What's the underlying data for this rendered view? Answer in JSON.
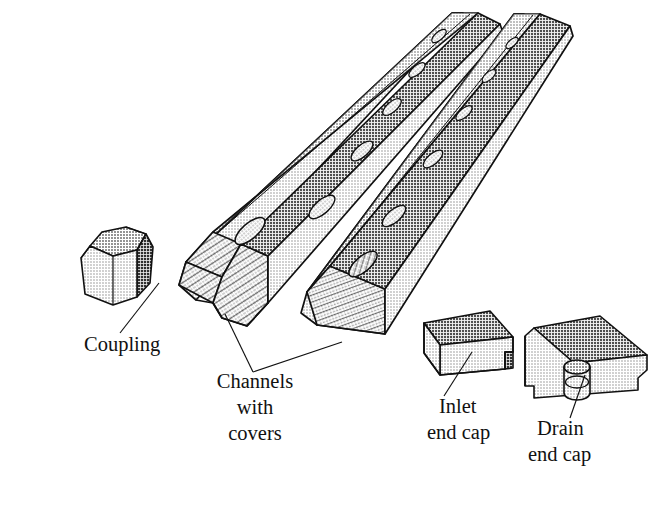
{
  "figure": {
    "kind": "exploded-assembly-line-drawing",
    "background_color": "#ffffff",
    "line_color": "#111111",
    "fill_light": "#dcdcdc",
    "fill_mid": "#c8c8c8",
    "fill_dark": "#a8a8a8",
    "fill_shadow": "#8f8f8f"
  },
  "labels": [
    {
      "id": "coupling",
      "name": "coupling-label",
      "lines": [
        "Coupling"
      ],
      "x": 84,
      "y": 351,
      "align": "start",
      "leader": [
        [
          120,
          333
        ],
        [
          159,
          283
        ]
      ]
    },
    {
      "id": "channels",
      "name": "channels-with-covers-label",
      "lines": [
        "Channels",
        "with",
        "covers"
      ],
      "x": 255,
      "y": 388,
      "align": "middle",
      "leader_join": [
        253,
        372
      ],
      "leader_a": [
        [
          253,
          372
        ],
        [
          225,
          314
        ]
      ],
      "leader_b": [
        [
          253,
          372
        ],
        [
          342,
          342
        ]
      ]
    },
    {
      "id": "inlet",
      "name": "inlet-end-cap-label",
      "lines": [
        "Inlet",
        "end cap"
      ],
      "x": 439,
      "y": 413,
      "align": "start",
      "leader": [
        [
          444,
          396
        ],
        [
          472,
          352
        ]
      ]
    },
    {
      "id": "drain",
      "name": "drain-end-cap-label",
      "lines": [
        "Drain",
        "end cap"
      ],
      "x": 537,
      "y": 435,
      "align": "start",
      "leader": [
        [
          570,
          418
        ],
        [
          585,
          375
        ]
      ]
    }
  ],
  "parts": [
    {
      "id": "coupling",
      "name": "coupling-part",
      "description": "Short chamfered connector block shown separate at left"
    },
    {
      "id": "channel-left",
      "name": "channel-left-part",
      "description": "Deep channel with cover, chamfered end, hatched cut face, row of drain holes"
    },
    {
      "id": "channel-right",
      "name": "channel-right-part",
      "description": "Shallow channel with cover, hatched cut face, row of drain holes"
    },
    {
      "id": "inlet-end-cap",
      "name": "inlet-end-cap-part",
      "description": "Flat end cap with stepped notch at right end"
    },
    {
      "id": "drain-end-cap",
      "name": "drain-end-cap-part",
      "description": "End cap with cylindrical drain spout on front face"
    }
  ],
  "channel_left_holes": [
    {
      "cx": 439,
      "cy": 36,
      "rx": 9,
      "ry": 4.0
    },
    {
      "cx": 417,
      "cy": 70,
      "rx": 10,
      "ry": 4.4
    },
    {
      "cx": 392,
      "cy": 107,
      "rx": 11.5,
      "ry": 5.0
    },
    {
      "cx": 362,
      "cy": 151,
      "rx": 13.5,
      "ry": 5.8
    },
    {
      "cx": 324,
      "cy": 207,
      "rx": 16,
      "ry": 6.8
    },
    {
      "cx": 252,
      "cy": 231,
      "rx": 18.5,
      "ry": 7.8
    }
  ],
  "channel_right_holes": [
    {
      "cx": 512,
      "cy": 43,
      "rx": 7.5,
      "ry": 3.4
    },
    {
      "cx": 489,
      "cy": 76,
      "rx": 8.5,
      "ry": 3.8
    },
    {
      "cx": 464,
      "cy": 113,
      "rx": 10,
      "ry": 4.4
    },
    {
      "cx": 433,
      "cy": 159,
      "rx": 12,
      "ry": 5.2
    },
    {
      "cx": 394,
      "cy": 216,
      "rx": 14.5,
      "ry": 6.2
    },
    {
      "cx": 363,
      "cy": 264,
      "rx": 17.5,
      "ry": 7.5
    }
  ]
}
